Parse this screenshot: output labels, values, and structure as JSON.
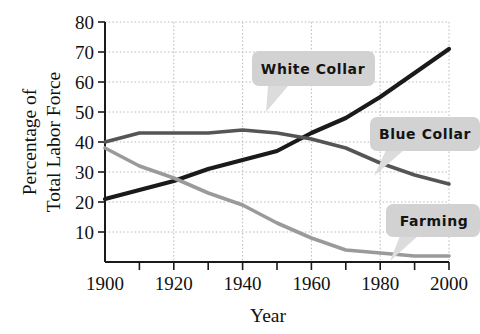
{
  "chart_data": {
    "type": "line",
    "title": "",
    "xlabel": "Year",
    "ylabel_line1": "Percentage of",
    "ylabel_line2": "Total Labor Force",
    "xlim": [
      1900,
      2000
    ],
    "ylim": [
      0,
      80
    ],
    "grid": true,
    "legend_position": "inline-callouts",
    "x_tick_labels": [
      "1900",
      "1920",
      "1940",
      "1960",
      "1980",
      "2000"
    ],
    "x_tick_values": [
      1900,
      1920,
      1940,
      1960,
      1980,
      2000
    ],
    "x_minor_tick_values": [
      1910,
      1930,
      1950,
      1970,
      1990
    ],
    "y_tick_labels": [
      "10",
      "20",
      "30",
      "40",
      "50",
      "60",
      "70",
      "80"
    ],
    "y_tick_values": [
      10,
      20,
      30,
      40,
      50,
      60,
      70,
      80
    ],
    "x": [
      1900,
      1910,
      1920,
      1930,
      1940,
      1950,
      1960,
      1970,
      1980,
      1990,
      2000
    ],
    "series": [
      {
        "name": "White Collar",
        "color": "#1a1a1a",
        "values": [
          21,
          24,
          27,
          31,
          34,
          37,
          43,
          48,
          55,
          63,
          71
        ]
      },
      {
        "name": "Blue Collar",
        "color": "#555555",
        "values": [
          40,
          43,
          43,
          43,
          44,
          43,
          41,
          38,
          33,
          29,
          26
        ]
      },
      {
        "name": "Farming",
        "color": "#9a9a9a",
        "values": [
          38,
          32,
          28,
          23,
          19,
          13,
          8,
          4,
          3,
          2,
          2
        ]
      }
    ],
    "annotations": [
      {
        "label": "White Collar",
        "anchor_x": 1949,
        "anchor_y": 44
      },
      {
        "label": "Blue Collar",
        "anchor_x": 1972,
        "anchor_y": 34
      },
      {
        "label": "Farming",
        "anchor_x": 1980,
        "anchor_y": 4
      }
    ]
  },
  "axes": {
    "y_label_line1": "Percentage of",
    "y_label_line2": "Total Labor Force",
    "x_label": "Year"
  },
  "ticks": {
    "y": [
      "80",
      "70",
      "60",
      "50",
      "40",
      "30",
      "20",
      "10"
    ],
    "x": [
      "1900",
      "1920",
      "1940",
      "1960",
      "1980",
      "2000"
    ]
  },
  "callouts": {
    "white_collar": "White Collar",
    "blue_collar": "Blue Collar",
    "farming": "Farming"
  },
  "colors": {
    "white_collar": "#1a1a1a",
    "blue_collar": "#555555",
    "farming": "#9a9a9a",
    "callout_bg": "#d2d2d2",
    "grid": "#b8b8b8",
    "axis": "#1a1a1a",
    "background": "#ffffff"
  }
}
